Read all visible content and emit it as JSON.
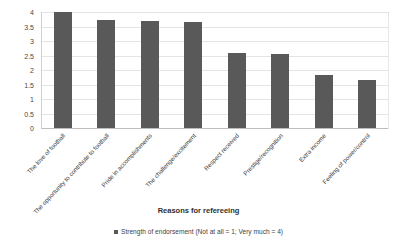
{
  "chart_data": {
    "type": "bar",
    "title": "",
    "xlabel": "Reasons for refereeing",
    "ylabel": "",
    "ylim": [
      0,
      4
    ],
    "grid": true,
    "legend_position": "bottom",
    "categories": [
      "The love of football",
      "The opportunity to contribute to football",
      "Pride in accomplishments",
      "The challenge/excitement",
      "Respect received",
      "Prestige/recognition",
      "Extra income",
      "Feeling of power/control"
    ],
    "values": [
      4.0,
      3.73,
      3.68,
      3.65,
      2.6,
      2.56,
      1.83,
      1.66
    ],
    "series": [
      {
        "name": "Strength of endorsement (Not at all = 1; Very much = 4)",
        "values": [
          4.0,
          3.73,
          3.68,
          3.65,
          2.6,
          2.56,
          1.83,
          1.66
        ],
        "color": "#595959"
      }
    ],
    "y_ticks": [
      "0",
      "0.5",
      "1",
      "1.5",
      "2",
      "2.5",
      "3",
      "3.5",
      "4"
    ],
    "y_tick_values": [
      0,
      0.5,
      1,
      1.5,
      2,
      2.5,
      3,
      3.5,
      4
    ]
  },
  "legend": {
    "entries": [
      {
        "label": "Strength of endorsement (Not at all = 1; Very much = 4)",
        "color": "#595959"
      }
    ]
  },
  "axis": {
    "x_title": "Reasons for refereeing"
  },
  "colors": {
    "bar": "#595959",
    "gridline": "#e4e4e4",
    "axis": "#bdbdbd",
    "text": "#3f3f3f",
    "background": "#ffffff"
  }
}
